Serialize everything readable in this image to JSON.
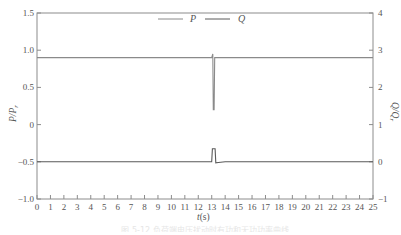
{
  "chart_data": {
    "type": "line",
    "title": "",
    "xlabel": "t(s)",
    "ylabel_left": "P/P_r",
    "ylabel_right": "Q/Q_r",
    "xlim": [
      0,
      25
    ],
    "ylim_left": [
      -1.0,
      1.5
    ],
    "ylim_right": [
      -1,
      4
    ],
    "x_ticks": [
      0,
      1,
      2,
      3,
      4,
      5,
      6,
      7,
      8,
      9,
      10,
      11,
      12,
      13,
      14,
      15,
      16,
      17,
      18,
      19,
      20,
      21,
      22,
      23,
      24,
      25
    ],
    "y_ticks_left": [
      "-1.0",
      "-0.5",
      "0",
      "0.5",
      "1.0",
      "1.5"
    ],
    "y_ticks_right": [
      "-1",
      "0",
      "1",
      "2",
      "3",
      "4"
    ],
    "grid": false,
    "legend_position": "top-center",
    "series": [
      {
        "name": "P",
        "axis": "left",
        "color": "#8a8a8a",
        "x": [
          0,
          13.0,
          13.08,
          13.12,
          13.18,
          13.22,
          13.3,
          25
        ],
        "y": [
          0.9,
          0.9,
          0.95,
          0.2,
          0.2,
          0.9,
          0.9,
          0.9
        ]
      },
      {
        "name": "Q",
        "axis": "right",
        "color": "#5a5a5a",
        "x": [
          0,
          13.0,
          13.05,
          13.25,
          13.3,
          13.5,
          14.0,
          25
        ],
        "y": [
          0,
          0,
          0.35,
          0.35,
          -0.03,
          -0.02,
          0,
          0
        ]
      }
    ]
  },
  "legend": {
    "p_label": "P",
    "q_label": "Q"
  },
  "axes": {
    "x_title_italic": "t",
    "x_title_unit": "(s)",
    "left_title": "P/P",
    "left_title_sub": "r",
    "right_title": "Q/Q",
    "right_title_sub": "r"
  },
  "caption": "图 5-12  负荷端电压扰动时有功和无功功率曲线"
}
